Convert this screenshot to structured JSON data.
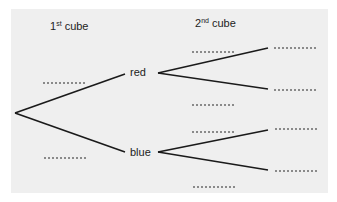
{
  "headers": {
    "first": {
      "num": "1",
      "sup": "st",
      "word": " cube"
    },
    "second": {
      "num": "2",
      "sup": "nd",
      "word": " cube"
    }
  },
  "nodes": {
    "red": "red",
    "blue": "blue"
  },
  "blanks": {
    "first_red_prob": "",
    "first_blue_prob": "",
    "second_red_red_prob": "",
    "second_red_blue_prob": "",
    "second_blue_red_prob": "",
    "second_blue_blue_prob": "",
    "outcome_red_red": "",
    "outcome_red_blue": "",
    "outcome_blue_red": "",
    "outcome_blue_blue": ""
  },
  "colors": {
    "panel": "#efefef",
    "line": "#1a1a1a",
    "dots": "#8a8a8a"
  }
}
